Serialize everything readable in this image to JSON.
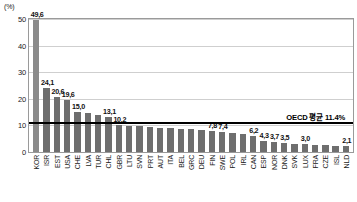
{
  "chart_data": {
    "type": "bar",
    "title": "",
    "subtitle": "",
    "xlabel": "",
    "ylabel": "",
    "unit_label": "(%)",
    "ylim": [
      0,
      50
    ],
    "yticks": [
      0,
      10,
      20,
      30,
      40,
      50
    ],
    "ytick_labels": [
      "0",
      "10",
      "20",
      "30",
      "40",
      "50"
    ],
    "grid": true,
    "legend": "none",
    "categories": [
      "KOR",
      "ISR",
      "EST",
      "USA",
      "CHE",
      "LVA",
      "TUR",
      "CHL",
      "GBR",
      "LTU",
      "SVN",
      "PRT",
      "AUT",
      "ITA",
      "BEL",
      "GRC",
      "DEU",
      "FIN",
      "SWE",
      "POL",
      "IRL",
      "CAN",
      "ESP",
      "NOR",
      "DNK",
      "SVK",
      "LUX",
      "FRA",
      "CZE",
      "ISL",
      "NLD"
    ],
    "values": [
      49.6,
      24.1,
      20.6,
      19.6,
      15.0,
      14.6,
      14.0,
      13.1,
      10.2,
      9.9,
      9.6,
      9.4,
      9.2,
      9.0,
      8.7,
      8.5,
      8.2,
      7.8,
      7.4,
      7.1,
      6.9,
      6.2,
      4.3,
      3.7,
      3.5,
      3.2,
      3.0,
      2.8,
      2.6,
      2.4,
      2.1
    ],
    "value_labels": [
      "49,6",
      "24,1",
      "20,6",
      "19,6",
      "15,0",
      "",
      "",
      "13,1",
      "10,2",
      "",
      "",
      "",
      "",
      "",
      "",
      "",
      "",
      "7,8",
      "7,4",
      "",
      "",
      "6,2",
      "4,3",
      "3,7",
      "3,5",
      "",
      "3,0",
      "",
      "",
      "",
      "2,1"
    ],
    "reference_line": {
      "value": 11.4,
      "label": "OECD 평균 11.4%",
      "color": "#000000"
    },
    "colors": {
      "bar": "#6e6e6e",
      "bar_highlight": "#8a8a8a",
      "grid": "#cfcfcf",
      "frame": "#9a9a9a",
      "text": "#1a1a1a"
    }
  }
}
